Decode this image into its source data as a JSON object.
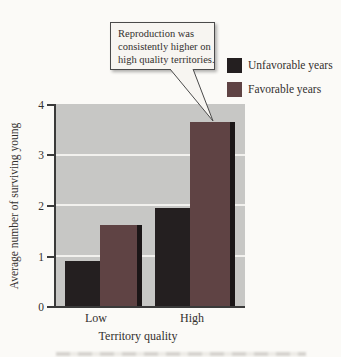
{
  "figure": {
    "annotation": {
      "lines": [
        "Reproduction was",
        "consistently higher on",
        "high quality territories."
      ]
    },
    "legend": {
      "items": [
        {
          "label": "Unfavorable years"
        },
        {
          "label": "Favorable years"
        }
      ]
    },
    "axes": {
      "ylabel": "Average number of surviving young",
      "xlabel": "Territory quality",
      "yticks": [
        "4",
        "3",
        "2",
        "1",
        "0"
      ],
      "xticklabels": [
        "Low",
        "High"
      ]
    }
  },
  "chart_data": {
    "type": "bar",
    "categories": [
      "Low",
      "High"
    ],
    "series": [
      {
        "name": "Unfavorable years",
        "color": "#241f20",
        "values": [
          0.9,
          1.95
        ]
      },
      {
        "name": "Favorable years",
        "color": "#5f4344",
        "values": [
          1.6,
          3.65
        ]
      }
    ],
    "title": "",
    "xlabel": "Territory quality",
    "ylabel": "Average number of surviving young",
    "ylim": [
      0,
      4
    ],
    "yticks": [
      0,
      1,
      2,
      3,
      4
    ],
    "grid": true,
    "gridline_color": "#f2f1ee",
    "plot_background": "#c7c7c5",
    "legend_position": "top-right",
    "annotation": "Reproduction was consistently higher on high quality territories.",
    "annotation_target": "High quality / Favorable years bar"
  }
}
